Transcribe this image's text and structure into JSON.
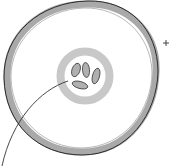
{
  "diagram": {
    "labels": [],
    "colors": {
      "membrane_fill": "#a9a9a9",
      "membrane_outline": "#2b2b2b",
      "vacuole_ring": "#c8c8c8",
      "organism_fill": "#b0b0b0",
      "organism_outline": "#3a3a3a",
      "pointer_line": "#333333",
      "background": "#ffffff"
    },
    "marker": "+"
  }
}
